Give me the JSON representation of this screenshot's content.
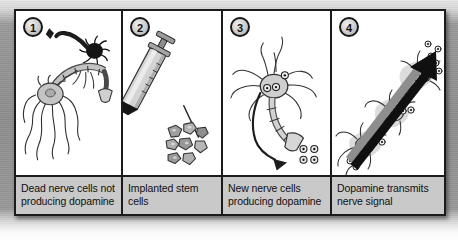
{
  "figure": {
    "type": "four-step-illustrated-diagram",
    "topic": "stem cell therapy for dopamine-producing nerve cells",
    "panels": [
      {
        "number": "1",
        "caption": "Dead nerve cells not producing dopamine",
        "illustration": "dead-nerve-cell-illustration",
        "elements": [
          "healthy-neuron-gray",
          "dead-neuron-black",
          "axon",
          "dendrites",
          "axon-terminal"
        ]
      },
      {
        "number": "2",
        "caption": "Implanted stem cells",
        "illustration": "syringe-with-stem-cells-illustration",
        "elements": [
          "syringe",
          "plunger",
          "needle",
          "stem-cell-cluster"
        ]
      },
      {
        "number": "3",
        "caption": "New nerve cells producing dopamine",
        "illustration": "new-nerve-cell-illustration",
        "elements": [
          "neuron-cell-body",
          "dendrites",
          "axon",
          "axon-terminal",
          "dopamine-molecules",
          "signal-arrow"
        ]
      },
      {
        "number": "4",
        "caption": "Dopamine transmits nerve signal",
        "illustration": "nerve-signal-transmission-illustration",
        "elements": [
          "neuron-chain",
          "dopamine-molecules",
          "signal-arrow-large"
        ]
      }
    ]
  },
  "colors": {
    "frame_border": "#1b1b1b",
    "panel_background": "#ffffff",
    "caption_background": "#c9c9c9",
    "caption_text": "#101010",
    "page_background": "#8e8e8e",
    "ink": "#2b2b2b",
    "cell_fill": "#bdbdbd",
    "dead_cell_fill": "#1a1a1a"
  }
}
